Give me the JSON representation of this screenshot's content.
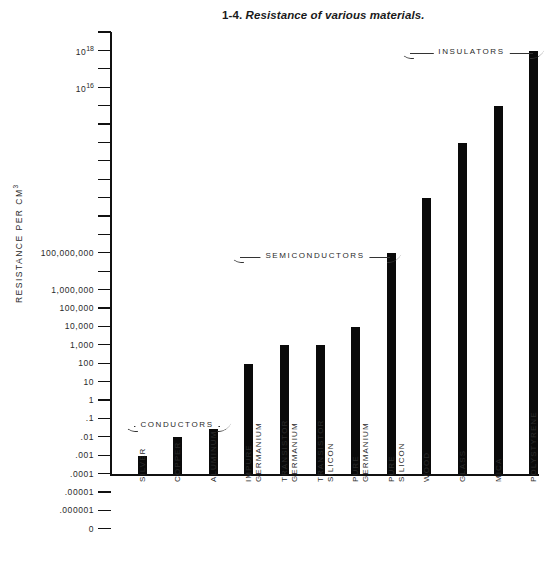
{
  "figure": {
    "number": "1-4.",
    "caption": "Resistance of various materials."
  },
  "axes": {
    "y_title_main": "RESISTANCE PER CM",
    "y_title_sup": "3",
    "y_tick_labels": [
      "",
      "10",
      "",
      "10",
      "",
      "",
      "",
      "",
      "",
      "",
      "",
      "",
      "100,000,000",
      "",
      "1,000,000",
      "100,000",
      "10,000",
      "1,000",
      "100",
      "10",
      "1",
      ".1",
      ".01",
      ".001",
      ".0001",
      ".00001",
      ".000001",
      "0"
    ]
  },
  "groups": [
    {
      "label": "CONDUCTORS"
    },
    {
      "label": "SEMICONDUCTORS"
    },
    {
      "label": "INSULATORS"
    }
  ],
  "chart_data": {
    "type": "bar",
    "title": "1-4. Resistance of various materials.",
    "xlabel": "",
    "ylabel": "RESISTANCE PER CM3",
    "yscale": "log",
    "ylim": [
      1e-07,
      1e+19
    ],
    "grid": false,
    "legend": "none",
    "categories": [
      "SILVER",
      "COPPER",
      "ALUMINUM",
      "IMPURE\nGERMANIUM",
      "TRANSISTOR\nGERMANIUM",
      "TRANSISTOR\nSILICON",
      "PURE\nGERMANIUM",
      "PURE\nSILICON",
      "WOOD",
      "GLASS",
      "MICA",
      "POLYSTYRENE"
    ],
    "values": [
      1e-06,
      1e-05,
      5e-05,
      0.1,
      1,
      1,
      10,
      100000,
      100000000,
      100000000000,
      10000000000000,
      10000000000000000
    ],
    "value_labels": [
      ".000001",
      ".00001",
      ".00005",
      ".1",
      "1",
      "1",
      "10",
      "100,000",
      "100,000,000",
      "10¹¹",
      "10¹³",
      "10¹⁶"
    ],
    "groups": [
      {
        "label": "CONDUCTORS",
        "from": "SILVER",
        "to": "ALUMINUM"
      },
      {
        "label": "SEMICONDUCTORS",
        "from": "IMPURE GERMANIUM",
        "to": "PURE SILICON"
      },
      {
        "label": "INSULATORS",
        "from": "WOOD",
        "to": "POLYSTYRENE"
      }
    ],
    "bar_color": "#0a0a0a",
    "background_color": "#ffffff"
  }
}
